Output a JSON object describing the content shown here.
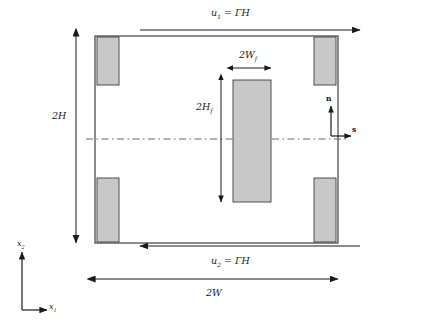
{
  "figure": {
    "type": "schematic-diagram",
    "background_color": "#ffffff",
    "line_color": "#1a1a1a",
    "block_fill_color": "#c8c8c8",
    "block_stroke_color": "#3c3c3c",
    "centerline_color": "#555555"
  },
  "labels": {
    "top_velocity": {
      "symbol": "u",
      "subscript": "1",
      "equals": "=",
      "value": "ΓH",
      "full": "u1 = ΓH"
    },
    "bottom_velocity": {
      "symbol": "u",
      "subscript": "2",
      "equals": "=",
      "value": "ΓH",
      "full": "u2 = ΓH"
    },
    "domain_height": "2H",
    "domain_width": "2W",
    "inclusion_width": {
      "symbol": "2W",
      "subscript": "f",
      "full": "2Wf"
    },
    "inclusion_height": {
      "symbol": "2H",
      "subscript": "f",
      "full": "2Hf"
    }
  },
  "local_frame": {
    "normal_label": "n",
    "tangent_label": "s"
  },
  "global_axes": {
    "horizontal_label": {
      "symbol": "x",
      "subscript": "1",
      "full": "x1"
    },
    "vertical_label": {
      "symbol": "x",
      "subscript": "2",
      "full": "x2"
    }
  },
  "geometry": {
    "domain": {
      "x": 95,
      "y": 36,
      "width": 243,
      "height": 207
    },
    "inclusion": {
      "x": 233,
      "y": 80,
      "width": 38,
      "height": 122
    },
    "corner_blocks": [
      {
        "name": "top-left",
        "x": 97,
        "y": 37,
        "width": 22,
        "height": 48
      },
      {
        "name": "top-right",
        "x": 314,
        "y": 37,
        "width": 22,
        "height": 48
      },
      {
        "name": "bottom-left",
        "x": 97,
        "y": 178,
        "width": 22,
        "height": 64
      },
      {
        "name": "bottom-right",
        "x": 314,
        "y": 178,
        "width": 22,
        "height": 64
      }
    ],
    "centerline_y": 139,
    "top_arrow": {
      "x1": 140,
      "x2": 360,
      "y": 30,
      "direction": "right"
    },
    "bottom_arrow": {
      "x1": 360,
      "x2": 140,
      "y": 246,
      "direction": "left"
    },
    "width_dimension": {
      "x1": 95,
      "x2": 338,
      "y": 279,
      "direction": "both"
    },
    "height_dimension": {
      "y1": 36,
      "y2": 243,
      "x": 76,
      "direction": "both"
    },
    "inclusion_width_dimension": {
      "x1": 233,
      "x2": 271,
      "y": 68,
      "direction": "both"
    },
    "inclusion_height_dimension": {
      "y1": 80,
      "y2": 202,
      "x": 221,
      "direction": "both"
    },
    "local_frame_origin": {
      "x": 331,
      "y": 136
    },
    "global_axes_origin": {
      "x": 22,
      "y": 310
    }
  }
}
